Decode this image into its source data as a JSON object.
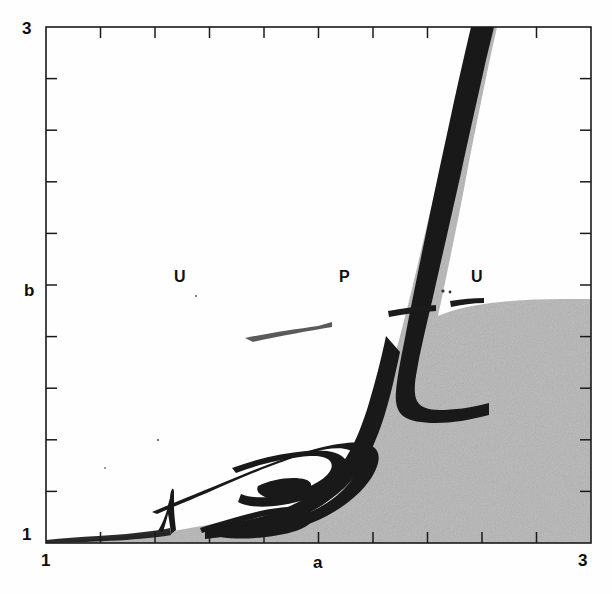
{
  "figure": {
    "kind": "parameter-plane-phase-diagram",
    "background": "#fefefe",
    "region_fill_gray": "#b3b3b3",
    "region_fill_white": "#ffffff",
    "curve_black": "#141414",
    "axis_color": "#1a1a1a"
  },
  "axes": {
    "x_label": "a",
    "y_label": "b",
    "x_min_label": "1",
    "x_max_label": "3",
    "y_min_label": "1",
    "y_max_label": "3",
    "x_range": [
      1,
      3
    ],
    "y_range": [
      1,
      3
    ],
    "x_ticks": [
      1,
      1.2,
      1.4,
      1.6,
      1.8,
      2.0,
      2.2,
      2.4,
      2.6,
      2.8,
      3.0
    ],
    "y_ticks": [
      1,
      1.2,
      1.4,
      1.6,
      1.8,
      2.0,
      2.2,
      2.4,
      2.6,
      2.8,
      3.0
    ],
    "tick_side": "inside",
    "grid": false
  },
  "region_labels": [
    {
      "text": "U",
      "x": 1.49,
      "y": 1.98
    },
    {
      "text": "P",
      "x": 2.11,
      "y": 1.98
    },
    {
      "text": "U",
      "x": 2.6,
      "y": 1.98
    }
  ],
  "chart_data": {
    "type": "heatmap",
    "title": "",
    "xlabel": "a",
    "ylabel": "b",
    "xlim": [
      1,
      3
    ],
    "ylim": [
      1,
      3
    ],
    "grid": false,
    "legend": "none",
    "categories": [
      "U",
      "P",
      "U"
    ],
    "series": [
      {
        "name": "gray-region-boundary",
        "comment": "upper-left boundary of the shaded (gray) stability region, traced from frame top down to the spiral core",
        "x": [
          2.03,
          2.04,
          2.056,
          2.078,
          2.104,
          2.136,
          2.17,
          2.2,
          2.222,
          2.234,
          2.238,
          2.23,
          2.208,
          2.17,
          2.12,
          2.06,
          1.996,
          1.93,
          1.866,
          1.806,
          1.752,
          1.7,
          1.65,
          1.6,
          1.548,
          1.492,
          1.43,
          1.36,
          1.288,
          1.212,
          1.138,
          1.074,
          1.028,
          1.004
        ],
        "y": [
          3.0,
          2.9,
          2.78,
          2.64,
          2.5,
          2.34,
          2.18,
          2.03,
          1.9,
          1.79,
          1.7,
          1.62,
          1.552,
          1.494,
          1.448,
          1.412,
          1.384,
          1.36,
          1.338,
          1.318,
          1.298,
          1.278,
          1.258,
          1.236,
          1.214,
          1.19,
          1.164,
          1.136,
          1.11,
          1.082,
          1.056,
          1.034,
          1.014,
          1.002
        ]
      },
      {
        "name": "gray-region-upper-right-edge",
        "comment": "near-horizontal top edge of the gray region to the right of the P tongue",
        "x": [
          2.24,
          2.32,
          2.42,
          2.54,
          2.68,
          2.82,
          2.94,
          3.0
        ],
        "y": [
          1.905,
          1.898,
          1.89,
          1.884,
          1.878,
          1.876,
          1.876,
          1.876
        ]
      },
      {
        "name": "spiral-arm-outer",
        "comment": "outermost dark spiral band around the period-doubling accumulation focus",
        "x": [
          1.33,
          1.4,
          1.48,
          1.57,
          1.66,
          1.74,
          1.8,
          1.84,
          1.856,
          1.846,
          1.81,
          1.752,
          1.682,
          1.604,
          1.528,
          1.462,
          1.414,
          1.392
        ],
        "y": [
          1.082,
          1.118,
          1.158,
          1.2,
          1.238,
          1.268,
          1.288,
          1.3,
          1.282,
          1.248,
          1.21,
          1.174,
          1.146,
          1.126,
          1.112,
          1.104,
          1.104,
          1.112
        ]
      },
      {
        "name": "spiral-arm-inner",
        "comment": "inner dark spiral turn",
        "x": [
          1.47,
          1.54,
          1.61,
          1.676,
          1.726,
          1.752,
          1.744,
          1.71,
          1.658,
          1.6,
          1.548,
          1.51,
          1.494
        ],
        "y": [
          1.14,
          1.168,
          1.196,
          1.22,
          1.238,
          1.248,
          1.236,
          1.216,
          1.192,
          1.172,
          1.156,
          1.148,
          1.15
        ]
      },
      {
        "name": "spiral-core",
        "comment": "innermost small loop at the spiral centre",
        "x": [
          1.572,
          1.608,
          1.64,
          1.658,
          1.652,
          1.626,
          1.594,
          1.57,
          1.562
        ],
        "y": [
          1.172,
          1.186,
          1.198,
          1.208,
          1.2,
          1.188,
          1.178,
          1.172,
          1.174
        ]
      },
      {
        "name": "cusp-spike",
        "comment": "sharp tongue / cusp rising from the baseline near a = 1.46",
        "x": [
          1.4,
          1.436,
          1.458,
          1.468,
          1.476,
          1.49,
          1.514
        ],
        "y": [
          1.04,
          1.092,
          1.158,
          1.178,
          1.126,
          1.07,
          1.038
        ]
      },
      {
        "name": "baseline-dark-band",
        "comment": "thin dark strip hugging the lower axis from a = 1 to the cusp",
        "x": [
          1.0,
          1.06,
          1.13,
          1.2,
          1.27,
          1.34,
          1.4
        ],
        "y": [
          1.006,
          1.01,
          1.016,
          1.024,
          1.032,
          1.042,
          1.052
        ]
      },
      {
        "name": "streak-upper",
        "comment": "faint thin dark streak crossing the white U region near b = 1.68",
        "x": [
          1.8,
          1.9,
          2.0,
          2.08,
          2.14
        ],
        "y": [
          1.6,
          1.636,
          1.672,
          1.7,
          1.718
        ]
      },
      {
        "name": "streak-right-a",
        "comment": "short dark dash lying on the gray upper edge",
        "x": [
          2.3,
          2.36,
          2.41
        ],
        "y": [
          1.872,
          1.876,
          1.878
        ]
      },
      {
        "name": "streak-right-b",
        "comment": "second short dark dash further right on the gray edge",
        "x": [
          2.47,
          2.52,
          2.56
        ],
        "y": [
          1.88,
          1.884,
          1.886
        ]
      }
    ],
    "annotations": [
      {
        "text": "U",
        "x": 1.49,
        "y": 1.98,
        "note": "unstable / divergent region (white, left)"
      },
      {
        "text": "P",
        "x": 2.11,
        "y": 1.98,
        "note": "periodic tongue (gray, centre)"
      },
      {
        "text": "U",
        "x": 2.6,
        "y": 1.98,
        "note": "unstable region (gray, right)"
      }
    ]
  }
}
